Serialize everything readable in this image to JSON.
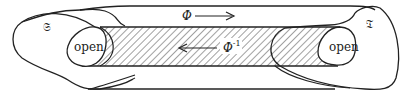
{
  "diagram": {
    "left_space_label": "𝔖",
    "right_space_label": "𝔗",
    "forward_map_label": "Φ",
    "inverse_map_label": "Φ",
    "inverse_exponent": "-1",
    "left_open_label": "open",
    "right_open_label": "open",
    "line_color": "#222222",
    "hatch_color": "#444444",
    "background": "#ffffff"
  }
}
